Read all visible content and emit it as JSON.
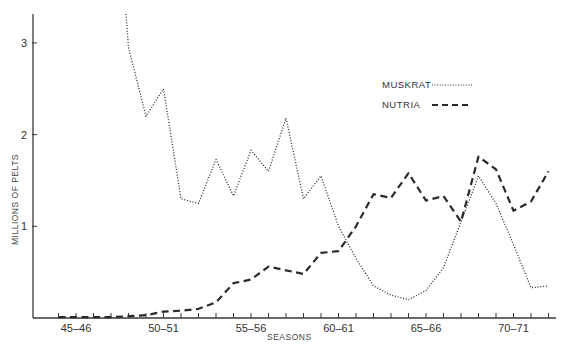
{
  "chart_data": {
    "type": "line",
    "title": "",
    "xlabel": "SEASONS",
    "ylabel": "MILLIONS OF PELTS",
    "ylim": [
      0,
      3.3
    ],
    "yticks": [
      1,
      2,
      3
    ],
    "ytick_labels": [
      "1",
      "2",
      "3"
    ],
    "xtick_labels": [
      "45-46",
      "50-51",
      "55-56",
      "60-61",
      "65-66",
      "70-71"
    ],
    "grid": false,
    "legend_position": "upper right (inside)",
    "categories": [
      "44-45",
      "45-46",
      "46-47",
      "47-48",
      "48-49",
      "49-50",
      "50-51",
      "51-52",
      "52-53",
      "53-54",
      "54-55",
      "55-56",
      "56-57",
      "57-58",
      "58-59",
      "59-60",
      "60-61",
      "61-62",
      "62-63",
      "63-64",
      "64-65",
      "65-66",
      "66-67",
      "67-68",
      "68-69",
      "69-70",
      "70-71",
      "71-72",
      "72-73"
    ],
    "series": [
      {
        "name": "MUSKRAT",
        "style": "dotted",
        "values": [
          null,
          null,
          null,
          null,
          2.95,
          2.2,
          2.5,
          1.3,
          1.25,
          1.73,
          1.33,
          1.83,
          1.6,
          2.18,
          1.3,
          1.55,
          1.0,
          0.65,
          0.35,
          0.25,
          0.2,
          0.3,
          0.55,
          1.05,
          1.55,
          1.25,
          0.8,
          0.33,
          0.35
        ],
        "note": "series enters from above the plot top (off-scale) near 47-48/48-49"
      },
      {
        "name": "NUTRIA",
        "style": "dashed",
        "values": [
          0.01,
          0.01,
          0.01,
          0.01,
          0.02,
          0.03,
          0.07,
          0.08,
          0.1,
          0.17,
          0.38,
          0.42,
          0.56,
          0.52,
          0.48,
          0.71,
          0.73,
          1.0,
          1.35,
          1.31,
          1.58,
          1.28,
          1.33,
          1.05,
          1.76,
          1.62,
          1.17,
          1.27,
          1.6
        ]
      }
    ]
  },
  "legend": {
    "items": [
      {
        "label": "MUSKRAT"
      },
      {
        "label": "NUTRIA"
      }
    ]
  },
  "axes": {
    "x_title": "SEASONS",
    "y_title": "MILLIONS OF PELTS"
  },
  "colors": {
    "line": "#2a2a2a",
    "axis": "#3a3a3a",
    "background": "#ffffff"
  }
}
